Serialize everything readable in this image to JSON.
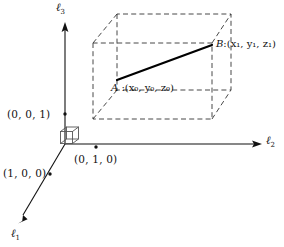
{
  "figure": {
    "background_color": "#ffffff",
    "ink_color": "#111111"
  },
  "axes": [
    {
      "id": "l1",
      "name": "axis-l1",
      "symbol": "ℓ",
      "subscript": "1",
      "label": "ℓ1",
      "direction": "down-left-diagonal",
      "label_x": 11,
      "label_y": 228
    },
    {
      "id": "l2",
      "name": "axis-l2",
      "symbol": "ℓ",
      "subscript": "2",
      "label": "ℓ2",
      "direction": "right-horizontal",
      "label_x": 266,
      "label_y": 139
    },
    {
      "id": "l3",
      "name": "axis-l3",
      "symbol": "ℓ",
      "subscript": "3",
      "label": "ℓ3",
      "direction": "up-vertical",
      "label_x": 56,
      "label_y": 3
    }
  ],
  "basis_points": [
    {
      "id": "e3",
      "name": "basis-point-001",
      "label": "(0, 0, 1)",
      "marker_x": 65,
      "marker_y": 114,
      "label_x": 7,
      "label_y": 109
    },
    {
      "id": "e2",
      "name": "basis-point-010",
      "label": "(0, 1, 0)",
      "marker_x": 96,
      "marker_y": 147,
      "label_x": 74,
      "label_y": 155
    },
    {
      "id": "e1",
      "name": "basis-point-100",
      "label": "(1, 0, 0)",
      "marker_x": 50,
      "marker_y": 174,
      "label_x": 3,
      "label_y": 168
    }
  ],
  "segment_points": [
    {
      "id": "A",
      "name": "point-a",
      "letter": "A",
      "separator": " :",
      "coords": "(x₀, y₀, z₀)",
      "coord_parts": [
        {
          "var": "x",
          "sub": "0",
          "sep": "("
        },
        {
          "var": "y",
          "sub": "0",
          "sep": ", "
        },
        {
          "var": "z",
          "sub": "0",
          "sep": ", "
        }
      ],
      "marker_x": 117,
      "marker_y": 80,
      "label_x": 111,
      "label_y": 83
    },
    {
      "id": "B",
      "name": "point-b",
      "letter": "B",
      "separator": ":",
      "coords": "(x₁, y₁, z₁)",
      "coord_parts": [
        {
          "var": "x",
          "sub": "1",
          "sep": "("
        },
        {
          "var": "y",
          "sub": "1",
          "sep": ", "
        },
        {
          "var": "z",
          "sub": "1",
          "sep": ", "
        }
      ],
      "marker_x": 212,
      "marker_y": 45,
      "label_x": 216,
      "label_y": 39
    }
  ],
  "origin_cube": {
    "name": "origin-unit-cube",
    "description": "small solid-line unit cube drawn at the origin"
  },
  "bounding_box": {
    "name": "dashed-bounding-box",
    "style": "dashed",
    "description": "dashed rectangular box (3D) enclosing points A and B"
  },
  "segment_ab": {
    "name": "segment-ab",
    "style": "solid-thick",
    "from": "A",
    "to": "B"
  }
}
